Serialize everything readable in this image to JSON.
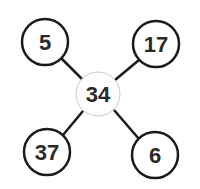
{
  "diagram": {
    "type": "number-star",
    "center": {
      "label": "34",
      "cx": 98,
      "cy": 94,
      "r": 22,
      "stroke": "#c8c8c8",
      "stroke_width": 1
    },
    "outer_nodes": [
      {
        "position": "top-left",
        "label": "5",
        "cx": 45,
        "cy": 42,
        "r": 23
      },
      {
        "position": "top-right",
        "label": "17",
        "cx": 156,
        "cy": 44,
        "r": 23
      },
      {
        "position": "bottom-left",
        "label": "37",
        "cx": 47,
        "cy": 152,
        "r": 23
      },
      {
        "position": "bottom-right",
        "label": "6",
        "cx": 155,
        "cy": 155,
        "r": 23
      }
    ],
    "colors": {
      "outer_stroke": "#1a1a1a",
      "connector": "#1a1a1a",
      "text": "#2a2a2a",
      "background": "#ffffff"
    }
  }
}
